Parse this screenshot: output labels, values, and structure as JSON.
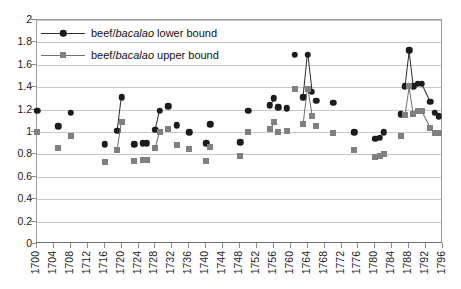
{
  "chart_data": {
    "type": "scatter",
    "title": "",
    "subtitle": "",
    "xlabel": "",
    "ylabel": "",
    "xlim": [
      1700,
      1796
    ],
    "ylim": [
      0,
      2
    ],
    "grid": true,
    "legend_position": "top-left",
    "y_ticks": [
      "0",
      "0.2",
      "0.4",
      "0.6",
      "0.8",
      "1",
      "1.2",
      "1.4",
      "1.6",
      "1.8",
      "2"
    ],
    "y_tick_values": [
      0,
      0.2,
      0.4,
      0.6,
      0.8,
      1,
      1.2,
      1.4,
      1.6,
      1.8,
      2
    ],
    "x_ticks": [
      "1700",
      "1704",
      "1708",
      "1712",
      "1716",
      "1720",
      "1724",
      "1728",
      "1732",
      "1736",
      "1740",
      "1744",
      "1748",
      "1752",
      "1756",
      "1760",
      "1764",
      "1768",
      "1772",
      "1776",
      "1780",
      "1784",
      "1788",
      "1792",
      "1796"
    ],
    "x_tick_values": [
      1700,
      1704,
      1708,
      1712,
      1716,
      1720,
      1724,
      1728,
      1732,
      1736,
      1740,
      1744,
      1748,
      1752,
      1756,
      1760,
      1764,
      1768,
      1772,
      1776,
      1780,
      1784,
      1788,
      1792,
      1796
    ],
    "legend": [
      {
        "label_html": "beef/<i>bacalao</i> lower bound",
        "label": "beef/bacalao lower bound",
        "marker": "circle",
        "color": "#1c1c1c"
      },
      {
        "label_html": "beef/<i>bacalao</i> upper bound",
        "label": "beef/bacalao upper bound",
        "marker": "square",
        "color": "#808080"
      }
    ],
    "series": [
      {
        "name": "beef/bacalao lower bound",
        "marker": "circle",
        "color": "#1c1c1c",
        "points": [
          {
            "x": 1700,
            "y": 1.19
          },
          {
            "x": 1705,
            "y": 1.05
          },
          {
            "x": 1708,
            "y": 1.17
          },
          {
            "x": 1716,
            "y": 0.89
          },
          {
            "x": 1719,
            "y": 1.01
          },
          {
            "x": 1720,
            "y": 1.31
          },
          {
            "x": 1723,
            "y": 0.89
          },
          {
            "x": 1725,
            "y": 0.9
          },
          {
            "x": 1726,
            "y": 0.9
          },
          {
            "x": 1728,
            "y": 1.02
          },
          {
            "x": 1729,
            "y": 1.19
          },
          {
            "x": 1731,
            "y": 1.23
          },
          {
            "x": 1733,
            "y": 1.06
          },
          {
            "x": 1736,
            "y": 1.0
          },
          {
            "x": 1740,
            "y": 0.9
          },
          {
            "x": 1741,
            "y": 1.07
          },
          {
            "x": 1748,
            "y": 0.91
          },
          {
            "x": 1750,
            "y": 1.19
          },
          {
            "x": 1755,
            "y": 1.24
          },
          {
            "x": 1756,
            "y": 1.3
          },
          {
            "x": 1757,
            "y": 1.22
          },
          {
            "x": 1759,
            "y": 1.21
          },
          {
            "x": 1761,
            "y": 1.69
          },
          {
            "x": 1763,
            "y": 1.31
          },
          {
            "x": 1764,
            "y": 1.69
          },
          {
            "x": 1765,
            "y": 1.36
          },
          {
            "x": 1766,
            "y": 1.28
          },
          {
            "x": 1770,
            "y": 1.26
          },
          {
            "x": 1775,
            "y": 1.0
          },
          {
            "x": 1780,
            "y": 0.94
          },
          {
            "x": 1781,
            "y": 0.95
          },
          {
            "x": 1782,
            "y": 1.0
          },
          {
            "x": 1786,
            "y": 1.16
          },
          {
            "x": 1787,
            "y": 1.41
          },
          {
            "x": 1788,
            "y": 1.73
          },
          {
            "x": 1789,
            "y": 1.41
          },
          {
            "x": 1790,
            "y": 1.43
          },
          {
            "x": 1791,
            "y": 1.43
          },
          {
            "x": 1793,
            "y": 1.27
          },
          {
            "x": 1794,
            "y": 1.17
          },
          {
            "x": 1795,
            "y": 1.14
          }
        ],
        "connections": [
          [
            1719,
            1720
          ],
          [
            1728,
            1729
          ],
          [
            1755,
            1756
          ],
          [
            1763,
            1764
          ],
          [
            1764,
            1765
          ],
          [
            1787,
            1788
          ],
          [
            1788,
            1789
          ],
          [
            1789,
            1790
          ],
          [
            1790,
            1791
          ],
          [
            1791,
            1793
          ]
        ]
      },
      {
        "name": "beef/bacalao upper bound",
        "marker": "square",
        "color": "#808080",
        "points": [
          {
            "x": 1700,
            "y": 1.0
          },
          {
            "x": 1705,
            "y": 0.86
          },
          {
            "x": 1708,
            "y": 0.96
          },
          {
            "x": 1716,
            "y": 0.73
          },
          {
            "x": 1719,
            "y": 0.84
          },
          {
            "x": 1720,
            "y": 1.09
          },
          {
            "x": 1723,
            "y": 0.74
          },
          {
            "x": 1725,
            "y": 0.75
          },
          {
            "x": 1726,
            "y": 0.75
          },
          {
            "x": 1728,
            "y": 0.86
          },
          {
            "x": 1729,
            "y": 1.0
          },
          {
            "x": 1731,
            "y": 1.03
          },
          {
            "x": 1733,
            "y": 0.88
          },
          {
            "x": 1736,
            "y": 0.85
          },
          {
            "x": 1740,
            "y": 0.74
          },
          {
            "x": 1741,
            "y": 0.87
          },
          {
            "x": 1748,
            "y": 0.79
          },
          {
            "x": 1750,
            "y": 1.0
          },
          {
            "x": 1755,
            "y": 1.03
          },
          {
            "x": 1756,
            "y": 1.09
          },
          {
            "x": 1757,
            "y": 1.0
          },
          {
            "x": 1759,
            "y": 1.01
          },
          {
            "x": 1761,
            "y": 1.38
          },
          {
            "x": 1763,
            "y": 1.07
          },
          {
            "x": 1764,
            "y": 1.38
          },
          {
            "x": 1765,
            "y": 1.14
          },
          {
            "x": 1766,
            "y": 1.05
          },
          {
            "x": 1770,
            "y": 0.99
          },
          {
            "x": 1775,
            "y": 0.84
          },
          {
            "x": 1780,
            "y": 0.78
          },
          {
            "x": 1781,
            "y": 0.79
          },
          {
            "x": 1782,
            "y": 0.8
          },
          {
            "x": 1786,
            "y": 0.96
          },
          {
            "x": 1787,
            "y": 1.15
          },
          {
            "x": 1788,
            "y": 1.41
          },
          {
            "x": 1789,
            "y": 1.16
          },
          {
            "x": 1790,
            "y": 1.19
          },
          {
            "x": 1791,
            "y": 1.19
          },
          {
            "x": 1793,
            "y": 1.04
          },
          {
            "x": 1794,
            "y": 0.99
          },
          {
            "x": 1795,
            "y": 0.99
          }
        ],
        "connections": [
          [
            1719,
            1720
          ],
          [
            1728,
            1729
          ],
          [
            1755,
            1756
          ],
          [
            1763,
            1764
          ],
          [
            1764,
            1765
          ],
          [
            1787,
            1788
          ],
          [
            1788,
            1789
          ],
          [
            1789,
            1790
          ],
          [
            1790,
            1791
          ],
          [
            1791,
            1793
          ]
        ]
      }
    ]
  }
}
